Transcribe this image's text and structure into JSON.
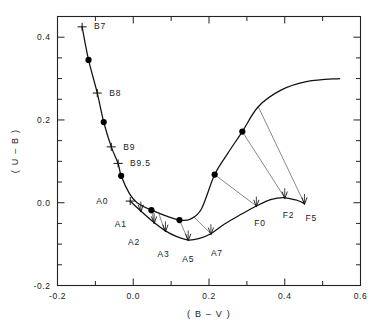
{
  "chart_data": {
    "type": "line",
    "title": "",
    "xlabel": "(B-V)",
    "ylabel": "(U-B)",
    "xlim": [
      -0.2,
      0.6
    ],
    "ylim": [
      -0.2,
      0.45
    ],
    "xticks": [
      "-0.2",
      "0.0",
      "0.2",
      "0.4",
      "0.6"
    ],
    "xtick_values": [
      -0.2,
      0.0,
      0.2,
      0.4,
      0.6
    ],
    "yticks": [
      "0.4",
      "0.2",
      "0.0",
      "-0.2"
    ],
    "ytick_values": [
      0.4,
      0.2,
      0.0,
      -0.2
    ],
    "minor_tick_step_x": 0.1,
    "minor_tick_step_y": 0.05,
    "y_axis_inverted": true,
    "grid": false,
    "legend": "none",
    "series": [
      {
        "name": "upper-curve",
        "comment": "unreddened main sequence, B7 through F5 on upper branch",
        "points": [
          {
            "x": -0.135,
            "y": 0.425
          },
          {
            "x": -0.118,
            "y": 0.345
          },
          {
            "x": -0.095,
            "y": 0.265
          },
          {
            "x": -0.078,
            "y": 0.195
          },
          {
            "x": -0.058,
            "y": 0.135
          },
          {
            "x": -0.04,
            "y": 0.095
          },
          {
            "x": -0.032,
            "y": 0.065
          },
          {
            "x": -0.01,
            "y": 0.022
          },
          {
            "x": 0.01,
            "y": 0.0
          },
          {
            "x": 0.048,
            "y": -0.018
          },
          {
            "x": 0.09,
            "y": -0.033
          },
          {
            "x": 0.122,
            "y": -0.042
          },
          {
            "x": 0.15,
            "y": -0.04
          },
          {
            "x": 0.18,
            "y": -0.015
          },
          {
            "x": 0.215,
            "y": 0.068
          },
          {
            "x": 0.25,
            "y": 0.12
          },
          {
            "x": 0.288,
            "y": 0.172
          },
          {
            "x": 0.33,
            "y": 0.232
          },
          {
            "x": 0.39,
            "y": 0.272
          },
          {
            "x": 0.46,
            "y": 0.293
          },
          {
            "x": 0.545,
            "y": 0.3
          }
        ]
      },
      {
        "name": "lower-curve",
        "comment": "reddened / luminosity-shifted sequence A0 through F5",
        "points": [
          {
            "x": -0.008,
            "y": 0.004
          },
          {
            "x": 0.02,
            "y": -0.02
          },
          {
            "x": 0.055,
            "y": -0.048
          },
          {
            "x": 0.085,
            "y": -0.068
          },
          {
            "x": 0.115,
            "y": -0.082
          },
          {
            "x": 0.145,
            "y": -0.09
          },
          {
            "x": 0.175,
            "y": -0.086
          },
          {
            "x": 0.205,
            "y": -0.075
          },
          {
            "x": 0.24,
            "y": -0.052
          },
          {
            "x": 0.285,
            "y": -0.028
          },
          {
            "x": 0.325,
            "y": -0.008
          },
          {
            "x": 0.365,
            "y": 0.008
          },
          {
            "x": 0.4,
            "y": 0.012
          },
          {
            "x": 0.432,
            "y": 0.006
          },
          {
            "x": 0.452,
            "y": -0.002
          }
        ]
      }
    ],
    "markers": {
      "name": "filled-data-points",
      "points": [
        {
          "x": -0.118,
          "y": 0.345
        },
        {
          "x": -0.078,
          "y": 0.195
        },
        {
          "x": -0.032,
          "y": 0.065
        },
        {
          "x": 0.048,
          "y": -0.018
        },
        {
          "x": 0.122,
          "y": -0.042
        },
        {
          "x": 0.215,
          "y": 0.068
        },
        {
          "x": 0.288,
          "y": 0.172
        }
      ]
    },
    "connectors": {
      "name": "reddening-connector-lines",
      "comment": "thin lines joining upper curve points to lower curve points",
      "lines": [
        {
          "x1": 0.048,
          "y1": -0.018,
          "x2": 0.055,
          "y2": -0.048
        },
        {
          "x1": 0.068,
          "y1": -0.027,
          "x2": 0.083,
          "y2": -0.068
        },
        {
          "x1": 0.122,
          "y1": -0.042,
          "x2": 0.145,
          "y2": -0.09
        },
        {
          "x1": 0.16,
          "y1": -0.034,
          "x2": 0.205,
          "y2": -0.075
        },
        {
          "x1": 0.215,
          "y1": 0.068,
          "x2": 0.325,
          "y2": -0.008
        },
        {
          "x1": 0.288,
          "y1": 0.172,
          "x2": 0.4,
          "y2": 0.012
        },
        {
          "x1": 0.33,
          "y1": 0.232,
          "x2": 0.452,
          "y2": -0.002
        }
      ]
    },
    "spectral_labels": [
      {
        "label": "B7",
        "x": -0.135,
        "y": 0.425,
        "tick": "cross",
        "lx": 12,
        "ly": 2
      },
      {
        "label": "B8",
        "x": -0.095,
        "y": 0.265,
        "tick": "cross",
        "lx": 12,
        "ly": 3
      },
      {
        "label": "B9",
        "x": -0.058,
        "y": 0.135,
        "tick": "cross",
        "lx": 12,
        "ly": 3
      },
      {
        "label": "B9.5",
        "x": -0.04,
        "y": 0.095,
        "tick": "cross",
        "lx": 12,
        "ly": 3
      },
      {
        "label": "A0",
        "x": -0.008,
        "y": 0.004,
        "tick": "cross",
        "lx": -22,
        "ly": 3
      },
      {
        "label": "A1",
        "x": 0.02,
        "y": -0.02,
        "tick": "arrow",
        "lx": -14,
        "ly": 16
      },
      {
        "label": "A2",
        "x": 0.055,
        "y": -0.048,
        "tick": "arrow",
        "lx": -14,
        "ly": 22
      },
      {
        "label": "A3",
        "x": 0.085,
        "y": -0.068,
        "tick": "arrow",
        "lx": -8,
        "ly": 26
      },
      {
        "label": "A5",
        "x": 0.145,
        "y": -0.09,
        "tick": "arrow",
        "lx": -6,
        "ly": 22
      },
      {
        "label": "A7",
        "x": 0.205,
        "y": -0.075,
        "tick": "arrow",
        "lx": 0,
        "ly": 22
      },
      {
        "label": "F0",
        "x": 0.325,
        "y": -0.008,
        "tick": "arrow",
        "lx": -2,
        "ly": 20
      },
      {
        "label": "F2",
        "x": 0.4,
        "y": 0.012,
        "tick": "arrow",
        "lx": -2,
        "ly": 20
      },
      {
        "label": "F5",
        "x": 0.452,
        "y": -0.002,
        "tick": "arrow",
        "lx": 1,
        "ly": 17
      }
    ],
    "colors": {
      "curve": "#111111",
      "connector": "#555555",
      "marker": "#000000",
      "axis": "#222222",
      "text": "#1a1a1a",
      "background": "#ffffff"
    }
  }
}
